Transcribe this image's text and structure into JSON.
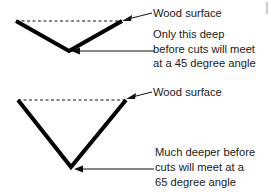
{
  "diagram": {
    "top_groove": {
      "surface_label": "Wood surface",
      "depth_label_lines": [
        "Only this deep",
        "before cuts will meet",
        "at a 45 degree angle"
      ],
      "angle_degrees": 45
    },
    "bottom_groove": {
      "surface_label": "Wood surface",
      "depth_label_lines": [
        "Much deeper before",
        "cuts will meet at a",
        "65 degree angle"
      ],
      "angle_degrees": 65
    }
  }
}
